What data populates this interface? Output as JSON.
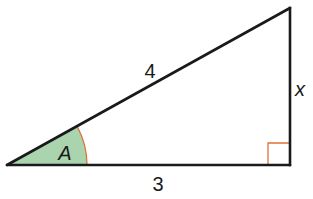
{
  "diagram": {
    "type": "right-triangle",
    "vertices": {
      "bottom_left": [
        7,
        165
      ],
      "bottom_right": [
        290,
        165
      ],
      "top_right": [
        290,
        8
      ]
    },
    "labels": {
      "hypotenuse": "4",
      "opposite": "x",
      "adjacent": "3",
      "angle": "A"
    },
    "colors": {
      "stroke": "#1a1a1a",
      "angle_fill": "#a9d4ae",
      "angle_arc": "#e0713a",
      "right_angle_marker": "#e0713a"
    }
  }
}
